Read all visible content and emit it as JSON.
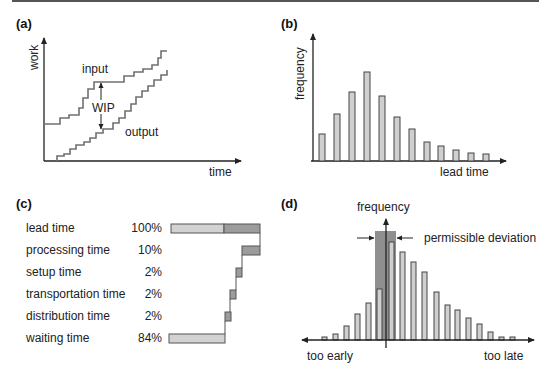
{
  "chart_data": [
    {
      "panel": "(a)",
      "type": "line",
      "title": "",
      "xlabel": "time",
      "ylabel": "work",
      "series": [
        {
          "name": "input",
          "style": "step"
        },
        {
          "name": "output",
          "style": "step"
        }
      ],
      "annotations": [
        "input",
        "output",
        "WIP"
      ],
      "grid": false
    },
    {
      "panel": "(b)",
      "type": "bar",
      "title": "",
      "xlabel": "lead time",
      "ylabel": "frequency",
      "categories": [
        "1",
        "2",
        "3",
        "4",
        "5",
        "6",
        "7",
        "8",
        "9",
        "10",
        "11",
        "12"
      ],
      "values": [
        27,
        47,
        69,
        89,
        65,
        44,
        31,
        19,
        15,
        11,
        8,
        7
      ],
      "grid": false
    },
    {
      "panel": "(c)",
      "type": "bar",
      "subtype": "waterfall",
      "title": "",
      "categories": [
        "lead time",
        "processing time",
        "setup time",
        "transportation time",
        "distribution time",
        "waiting time"
      ],
      "values": [
        100,
        10,
        2,
        2,
        2,
        84
      ],
      "value_labels": [
        "100%",
        "10%",
        "2%",
        "2%",
        "2%",
        "84%"
      ],
      "unit": "%"
    },
    {
      "panel": "(d)",
      "type": "bar",
      "title": "",
      "ylabel": "frequency",
      "xlabel_left": "too early",
      "xlabel_right": "too late",
      "annotations": [
        "permissible deviation"
      ],
      "values": [
        2,
        4,
        9,
        17,
        24,
        37,
        100,
        87,
        79,
        71,
        49,
        37,
        31,
        23,
        17,
        8,
        2,
        2
      ],
      "grid": false
    }
  ],
  "panels": {
    "a": {
      "label": "(a)",
      "ylabel": "work",
      "xlabel": "time",
      "input_label": "input",
      "output_label": "output",
      "wip_label": "WIP"
    },
    "b": {
      "label": "(b)",
      "ylabel": "frequency",
      "xlabel": "lead time",
      "bars": [
        {
          "x": 319,
          "top": 134
        },
        {
          "x": 334,
          "top": 114
        },
        {
          "x": 349,
          "top": 92
        },
        {
          "x": 364,
          "top": 72
        },
        {
          "x": 379,
          "top": 96
        },
        {
          "x": 394,
          "top": 117
        },
        {
          "x": 409,
          "top": 129
        },
        {
          "x": 424,
          "top": 142
        },
        {
          "x": 438,
          "top": 146
        },
        {
          "x": 453,
          "top": 150
        },
        {
          "x": 468,
          "top": 153
        },
        {
          "x": 483,
          "top": 154
        }
      ]
    },
    "c": {
      "label": "(c)",
      "rows": [
        {
          "name": "lead time",
          "pct": "100%"
        },
        {
          "name": "processing time",
          "pct": "10%"
        },
        {
          "name": "setup time",
          "pct": "2%"
        },
        {
          "name": "transportation time",
          "pct": "2%"
        },
        {
          "name": "distribution time",
          "pct": "2%"
        },
        {
          "name": "waiting time",
          "pct": "84%"
        }
      ]
    },
    "d": {
      "label": "(d)",
      "ylabel": "frequency",
      "annotation": "permissible deviation",
      "left_label": "too early",
      "right_label": "too late",
      "bars": [
        {
          "x": 322,
          "top": 337
        },
        {
          "x": 333,
          "top": 334
        },
        {
          "x": 344,
          "top": 326
        },
        {
          "x": 355,
          "top": 314
        },
        {
          "x": 366,
          "top": 303
        },
        {
          "x": 377,
          "top": 289
        },
        {
          "x": 389,
          "top": 242
        },
        {
          "x": 400,
          "top": 252
        },
        {
          "x": 411,
          "top": 262
        },
        {
          "x": 422,
          "top": 272
        },
        {
          "x": 434,
          "top": 292
        },
        {
          "x": 445,
          "top": 305
        },
        {
          "x": 455,
          "top": 310
        },
        {
          "x": 466,
          "top": 318
        },
        {
          "x": 477,
          "top": 324
        },
        {
          "x": 488,
          "top": 332
        },
        {
          "x": 499,
          "top": 337
        },
        {
          "x": 510,
          "top": 337
        }
      ]
    }
  },
  "colors": {
    "axis": "#222222",
    "line": "#707070",
    "bar_light": "#cfcfcf",
    "bar_dark": "#9a9a9a",
    "shade": "#8f8f8f",
    "bar_stroke": "#444444"
  }
}
